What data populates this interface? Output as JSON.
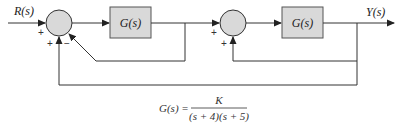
{
  "diagram": {
    "type": "block-diagram",
    "colors": {
      "line": "#333333",
      "block_fill": "#d9d9d9",
      "junction_fill": "#d9d9d9",
      "text": "#222222"
    },
    "input": {
      "label": "R(s)"
    },
    "output": {
      "label": "Y(s)"
    },
    "junctions": [
      {
        "id": "sum1",
        "signs": {
          "left": "+",
          "bottom_left": "+",
          "bottom_right": "−"
        }
      },
      {
        "id": "sum2",
        "signs": {
          "left": "+",
          "bottom": "+"
        }
      }
    ],
    "blocks": [
      {
        "id": "block1",
        "label": "G(s)"
      },
      {
        "id": "block2",
        "label": "G(s)"
      }
    ],
    "feedback_paths": [
      {
        "from": "block1 output",
        "to": "sum1",
        "sign": "−"
      },
      {
        "from": "block2 output",
        "to": "sum2",
        "sign": "+"
      },
      {
        "from": "Y(s)",
        "to": "sum1",
        "sign": "+"
      }
    ],
    "equation": {
      "lhs": "G(s) =",
      "numerator": "K",
      "denominator": "(s + 4)(s + 5)"
    }
  }
}
